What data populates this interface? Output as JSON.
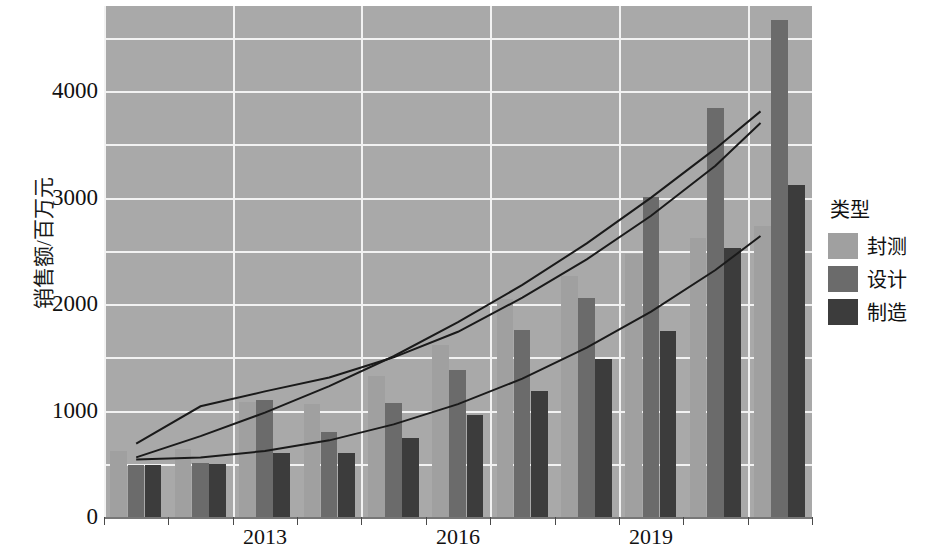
{
  "chart_data": {
    "type": "bar",
    "title": "",
    "xlabel": "",
    "ylabel": "销售额/百万元",
    "legend_title": "类型",
    "legend_position": "right",
    "grid": true,
    "ylim": [
      0,
      4800
    ],
    "yticks": [
      0,
      1000,
      2000,
      3000,
      4000
    ],
    "ytick_labels": [
      "0",
      "1000",
      "2000",
      "3000",
      "4000"
    ],
    "categories": [
      "2011",
      "2012",
      "2013",
      "2014",
      "2015",
      "2016",
      "2017",
      "2018",
      "2019",
      "2020",
      "2021"
    ],
    "xtick_labels": [
      "2013",
      "2016",
      "2019"
    ],
    "xtick_categories": [
      "2013",
      "2016",
      "2019"
    ],
    "series": [
      {
        "name": "封测",
        "color": "#a0a0a0",
        "values": [
          620,
          640,
          1080,
          1060,
          1320,
          1620,
          2050,
          2260,
          2470,
          2620,
          2730
        ]
      },
      {
        "name": "设计",
        "color": "#6b6b6b",
        "values": [
          490,
          510,
          1100,
          800,
          1070,
          1380,
          1760,
          2060,
          3010,
          3840,
          4670
        ]
      },
      {
        "name": "制造",
        "color": "#3c3c3c",
        "values": [
          490,
          500,
          600,
          600,
          740,
          960,
          1180,
          1480,
          1750,
          2530,
          3120
        ]
      }
    ],
    "trendlines": [
      {
        "name": "封测-trend",
        "points": [
          [
            0.5,
            690
          ],
          [
            1.5,
            1040
          ],
          [
            2.5,
            1180
          ],
          [
            3.5,
            1310
          ],
          [
            4.5,
            1500
          ],
          [
            5.5,
            1740
          ],
          [
            6.5,
            2060
          ],
          [
            7.5,
            2420
          ],
          [
            8.5,
            2830
          ],
          [
            9.5,
            3300
          ],
          [
            10.2,
            3700
          ]
        ]
      },
      {
        "name": "设计-trend",
        "points": [
          [
            0.5,
            560
          ],
          [
            1.5,
            760
          ],
          [
            2.5,
            980
          ],
          [
            3.5,
            1230
          ],
          [
            4.5,
            1510
          ],
          [
            5.5,
            1830
          ],
          [
            6.5,
            2180
          ],
          [
            7.5,
            2570
          ],
          [
            8.5,
            3000
          ],
          [
            9.5,
            3460
          ],
          [
            10.2,
            3810
          ]
        ]
      },
      {
        "name": "制造-trend",
        "points": [
          [
            0.5,
            540
          ],
          [
            1.5,
            560
          ],
          [
            2.5,
            620
          ],
          [
            3.5,
            720
          ],
          [
            4.5,
            870
          ],
          [
            5.5,
            1060
          ],
          [
            6.5,
            1300
          ],
          [
            7.5,
            1590
          ],
          [
            8.5,
            1930
          ],
          [
            9.5,
            2320
          ],
          [
            10.2,
            2640
          ]
        ]
      }
    ]
  },
  "legend": {
    "title": "类型",
    "items": [
      {
        "label": "封测",
        "color": "#a0a0a0"
      },
      {
        "label": "设计",
        "color": "#6b6b6b"
      },
      {
        "label": "制造",
        "color": "#3c3c3c"
      }
    ]
  },
  "axes": {
    "y_title": "销售额/百万元",
    "y_labels": [
      "4000",
      "3000",
      "2000",
      "1000",
      "0"
    ],
    "x_labels": [
      "2013",
      "2016",
      "2019"
    ]
  },
  "colors": {
    "plot_background": "#a9a9a9",
    "gridline": "#f2f2f2",
    "trendline": "#1a1a1a",
    "text": "#111111"
  }
}
